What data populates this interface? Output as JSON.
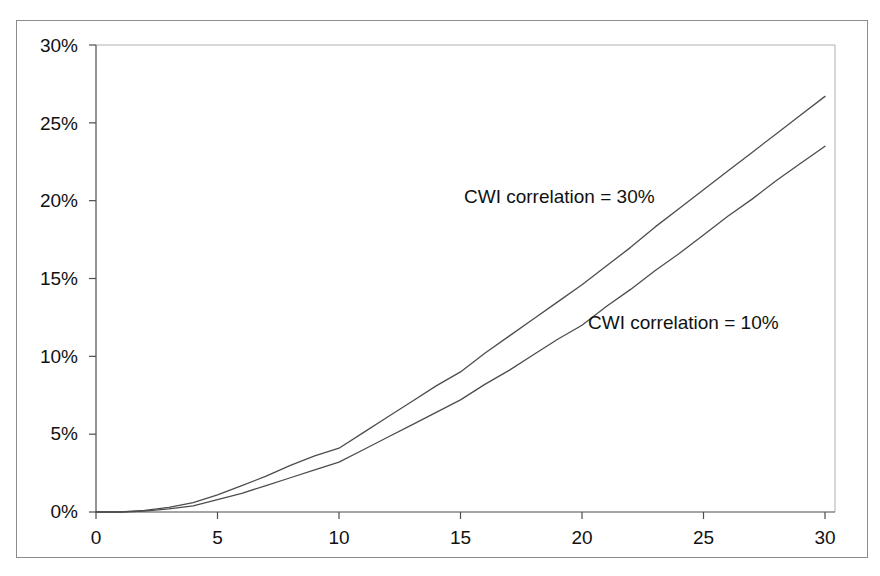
{
  "chart_data": {
    "type": "line",
    "title": "",
    "subtitle": "",
    "xlabel": "",
    "ylabel": "",
    "xlim": [
      0,
      30
    ],
    "ylim": [
      0,
      0.3
    ],
    "grid": false,
    "legend_position": "inline-annotation",
    "x_tick_labels": [
      "0",
      "5",
      "10",
      "15",
      "20",
      "25",
      "30"
    ],
    "x_ticks": [
      0,
      5,
      10,
      15,
      20,
      25,
      30
    ],
    "y_tick_labels": [
      "0%",
      "5%",
      "10%",
      "15%",
      "20%",
      "25%",
      "30%"
    ],
    "y_ticks": [
      0,
      5,
      10,
      15,
      20,
      25,
      30
    ],
    "x": [
      0,
      1,
      2,
      3,
      4,
      5,
      6,
      7,
      8,
      9,
      10,
      11,
      12,
      13,
      14,
      15,
      16,
      17,
      18,
      19,
      20,
      21,
      22,
      23,
      24,
      25,
      26,
      27,
      28,
      29,
      30
    ],
    "series": [
      {
        "name": "CWI correlation = 30%",
        "color": "#4d4d4d",
        "annotation": "CWI correlation = 30%",
        "values": [
          0.0,
          0.0,
          0.1,
          0.3,
          0.6,
          1.1,
          1.7,
          2.3,
          3.0,
          3.6,
          4.1,
          5.1,
          6.1,
          7.1,
          8.1,
          9.0,
          10.2,
          11.3,
          12.4,
          13.5,
          14.6,
          15.8,
          17.0,
          18.3,
          19.5,
          20.7,
          21.9,
          23.1,
          24.3,
          25.5,
          26.7
        ]
      },
      {
        "name": "CWI correlation = 10%",
        "color": "#4d4d4d",
        "annotation": "CWI correlation = 10%",
        "values": [
          0.0,
          0.0,
          0.05,
          0.2,
          0.4,
          0.8,
          1.2,
          1.7,
          2.2,
          2.7,
          3.2,
          4.0,
          4.8,
          5.6,
          6.4,
          7.2,
          8.2,
          9.1,
          10.1,
          11.1,
          12.0,
          13.2,
          14.3,
          15.5,
          16.6,
          17.8,
          19.0,
          20.1,
          21.3,
          22.4,
          23.5
        ]
      }
    ],
    "annotations": [
      {
        "text": "CWI correlation = 30%",
        "x_px": 464,
        "y_px": 186,
        "series_index": 0
      },
      {
        "text": "CWI correlation = 10%",
        "x_px": 588,
        "y_px": 312,
        "series_index": 1
      }
    ]
  },
  "axis_colors": {
    "axis_line": "#4d4d4d",
    "tick_mark": "#4d4d4d",
    "gridline": "#b0b0b0",
    "frame": "#8c8c8c",
    "curve": "#4d4d4d",
    "text": "#111111",
    "background": "#ffffff"
  }
}
